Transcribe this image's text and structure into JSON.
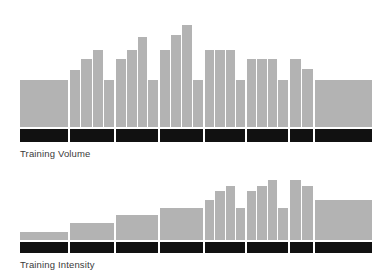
{
  "page": {
    "background_color": "#ffffff",
    "bar_color": "#b3b3b3",
    "phase_band_color": "#111111",
    "label_color": "#3a3a3a"
  },
  "charts": [
    {
      "id": "training-volume",
      "label": "Training Volume",
      "max_value": 100,
      "phases": [
        {
          "width_pct": 14.2,
          "text": "",
          "bars": [
            40
          ]
        },
        {
          "width_pct": 13.1,
          "text": "",
          "bars": [
            49,
            58,
            66,
            40
          ]
        },
        {
          "width_pct": 12.5,
          "text": "",
          "bars": [
            58,
            66,
            77,
            40
          ]
        },
        {
          "width_pct": 12.8,
          "text": "",
          "bars": [
            66,
            79,
            87,
            40
          ]
        },
        {
          "width_pct": 11.9,
          "text": "",
          "bars": [
            66,
            66,
            66,
            40
          ]
        },
        {
          "width_pct": 12.2,
          "text": "",
          "bars": [
            58,
            58,
            58,
            40
          ]
        },
        {
          "width_pct": 7.1,
          "text": "",
          "bars": [
            58,
            50
          ]
        },
        {
          "width_pct": 16.2,
          "text": "",
          "bars": [
            40
          ]
        }
      ]
    },
    {
      "id": "training-intensity",
      "label": "Training Intensity",
      "max_value": 100,
      "phases": [
        {
          "width_pct": 14.2,
          "text": "",
          "bars": [
            13
          ]
        },
        {
          "width_pct": 13.1,
          "text": "",
          "bars": [
            26
          ]
        },
        {
          "width_pct": 12.5,
          "text": "",
          "bars": [
            39
          ]
        },
        {
          "width_pct": 12.8,
          "text": "",
          "bars": [
            50
          ]
        },
        {
          "width_pct": 11.9,
          "text": "",
          "bars": [
            63,
            76,
            85,
            50
          ]
        },
        {
          "width_pct": 12.2,
          "text": "",
          "bars": [
            76,
            85,
            94,
            50
          ]
        },
        {
          "width_pct": 7.1,
          "text": "",
          "bars": [
            94,
            85
          ]
        },
        {
          "width_pct": 16.2,
          "text": "",
          "bars": [
            63
          ]
        }
      ]
    }
  ]
}
